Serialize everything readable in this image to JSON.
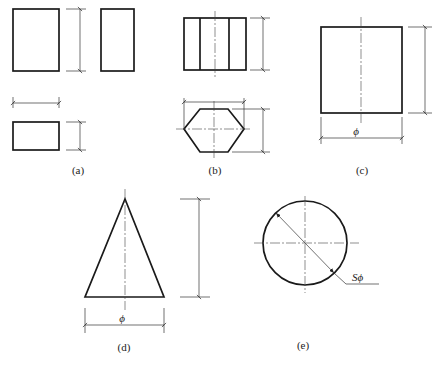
{
  "figure": {
    "panels": [
      {
        "id": "a",
        "label": "(a)",
        "shape": "rectangular prism (three views)"
      },
      {
        "id": "b",
        "label": "(b)",
        "shape": "hexagonal prism (two views)"
      },
      {
        "id": "c",
        "label": "(c)",
        "shape": "cylinder",
        "dimension_symbol": "ϕ"
      },
      {
        "id": "d",
        "label": "(d)",
        "shape": "cone",
        "dimension_symbol": "ϕ"
      },
      {
        "id": "e",
        "label": "(e)",
        "shape": "sphere",
        "dimension_symbol": "Sϕ"
      }
    ]
  },
  "colors": {
    "outline": "#1a1a1a",
    "dimension": "#333333",
    "background": "#ffffff"
  }
}
